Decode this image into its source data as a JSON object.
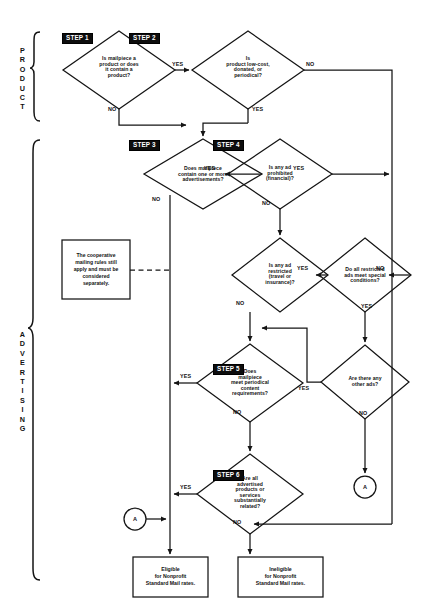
{
  "diagram": {
    "sections": [
      {
        "id": "product",
        "label": "PRODUCT"
      },
      {
        "id": "advertising",
        "label": "ADVERTISING"
      }
    ],
    "steps": [
      {
        "tag": "STEP 1",
        "text": "Is mailpiece a\nproduct or does\nit contain a\nproduct?"
      },
      {
        "tag": "STEP 2",
        "text": "Is\nproduct low-cost,\ndonated, or\nperiodical?"
      },
      {
        "tag": "STEP 3",
        "text": "Does mailpiece\ncontain one or more\nadvertisements?"
      },
      {
        "tag": "STEP 4",
        "text": "Is any ad\nprohibited\n(financial)?"
      },
      {
        "tag": "STEP 5",
        "text": "Does\nmailpiece\nmeet periodical\ncontent\nrequirements?"
      },
      {
        "tag": "STEP 6",
        "text": "Are all\nadvertised\nproducts or\nservices\nsubstantially\nrelated?"
      }
    ],
    "decisions": [
      {
        "id": "restricted",
        "text": "Is any ad\nrestricted\n(travel or\ninsurance)?"
      },
      {
        "id": "special-conditions",
        "text": "Do all restricted\nads meet special\nconditions?"
      },
      {
        "id": "other-ads",
        "text": "Are there any\nother ads?"
      }
    ],
    "note": {
      "text": "The cooperative\nmailing rules still\napply and must be\nconsidered\nseparately."
    },
    "terminals": [
      {
        "id": "eligible",
        "text": "Eligible\nfor Nonprofit\nStandard Mail rates."
      },
      {
        "id": "ineligible",
        "text": "Ineligible\nfor Nonprofit\nStandard Mail rates."
      }
    ],
    "connectors": [
      {
        "id": "connector-a-top",
        "label": "A"
      },
      {
        "id": "connector-a-bottom",
        "label": "A"
      }
    ],
    "edge_labels": {
      "step1_yes": "YES",
      "step1_no": "NO",
      "step2_no": "NO",
      "step2_yes": "YES",
      "step3_yes": "YES",
      "step3_no": "NO",
      "step4_yes": "YES",
      "step4_no": "NO",
      "restricted_yes": "YES",
      "restricted_no": "NO",
      "special_no": "NO",
      "special_yes": "YES",
      "other_yes": "YES",
      "other_no": "NO",
      "step5_yes": "YES",
      "step5_no": "NO",
      "step6_yes": "YES",
      "step6_no": "NO"
    },
    "colors": {
      "line": "#141414",
      "tag_bg": "#0d0d0d",
      "tag_fg": "#ffffff",
      "background": "#ffffff"
    }
  }
}
